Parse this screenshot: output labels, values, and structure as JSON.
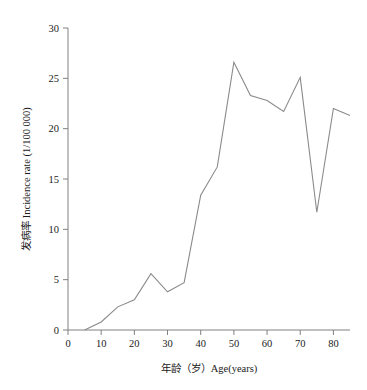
{
  "chart_data": {
    "type": "line",
    "title": "",
    "xlabel": "年龄（岁）Age(years)",
    "ylabel": "发病率 Incidence rate (1/100 000)",
    "xlim": [
      0,
      85
    ],
    "ylim": [
      0,
      30
    ],
    "xticks": [
      0,
      10,
      20,
      30,
      40,
      50,
      60,
      70,
      80
    ],
    "xtick_labels": [
      "0",
      "10",
      "20",
      "30",
      "40",
      "50",
      "60",
      "70",
      "80"
    ],
    "yticks": [
      0,
      5,
      10,
      15,
      20,
      25,
      30
    ],
    "ytick_labels": [
      "0",
      "5",
      "10",
      "15",
      "20",
      "25",
      "30"
    ],
    "grid": false,
    "legend": "none",
    "line_color": "#8a8a8a",
    "axis_color": "#808080",
    "x": [
      5,
      10,
      15,
      20,
      25,
      30,
      35,
      40,
      45,
      50,
      55,
      60,
      65,
      70,
      75,
      80,
      85
    ],
    "values": [
      0.0,
      0.8,
      2.3,
      3.0,
      5.6,
      3.8,
      4.7,
      13.4,
      16.2,
      26.6,
      23.3,
      22.8,
      21.7,
      25.1,
      11.7,
      22.0,
      21.3
    ],
    "series": [
      {
        "name": "Incidence rate",
        "values": [
          0.0,
          0.8,
          2.3,
          3.0,
          5.6,
          3.8,
          4.7,
          13.4,
          16.2,
          26.6,
          23.3,
          22.8,
          21.7,
          25.1,
          11.7,
          22.0,
          21.3
        ]
      }
    ]
  }
}
